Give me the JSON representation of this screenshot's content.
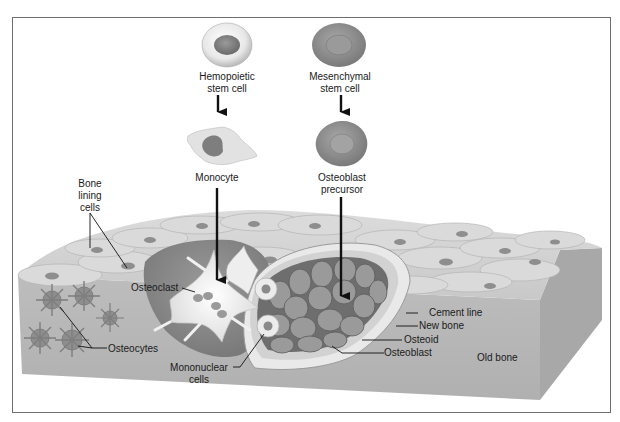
{
  "diagram": {
    "lineage": {
      "hemopoietic": {
        "stem_cell_line1": "Hemopoietic",
        "stem_cell_line2": "stem cell",
        "derived": "Monocyte"
      },
      "mesenchymal": {
        "stem_cell_line1": "Mesenchymal",
        "stem_cell_line2": "stem cell",
        "derived_line1": "Osteoblast",
        "derived_line2": "precursor"
      }
    },
    "labels": {
      "bone_lining_line1": "Bone",
      "bone_lining_line2": "lining",
      "bone_lining_line3": "cells",
      "osteoclast": "Osteoclast",
      "osteocytes": "Osteocytes",
      "mononuclear_line1": "Mononuclear",
      "mononuclear_line2": "cells",
      "cement_line": "Cement line",
      "new_bone": "New bone",
      "osteoid": "Osteoid",
      "osteoblast": "Osteoblast",
      "old_bone": "Old bone"
    },
    "colors": {
      "frame_border": "#6e6e6e",
      "bone_front": "#b9b9b9",
      "bone_side": "#a6a6a6",
      "lining_cells": "#d6d6d6",
      "nucleus": "#8a8a8a",
      "pit": "#8c8c8c",
      "osteoclast": "#f2f2f2",
      "osteoblast": "#7d7d7d",
      "osteoid": "#dedede",
      "new_bone": "#cfcfcf",
      "arrow": "#111111"
    }
  }
}
